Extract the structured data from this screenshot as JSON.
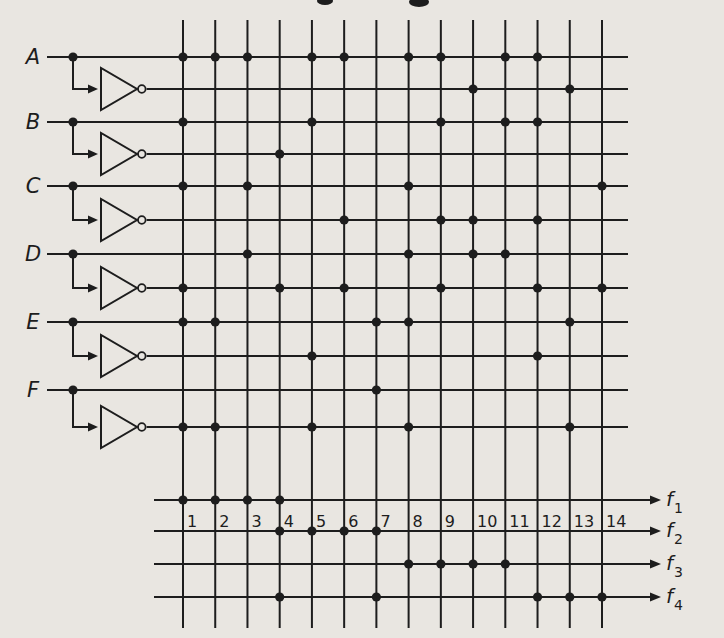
{
  "diagram": {
    "background_color": "#e9e6e1",
    "ink_color": "#1d1d1d",
    "inputs": [
      {
        "label": "A",
        "row_y": 57,
        "comp_y": 89,
        "true_term_dots": [
          1,
          2,
          3,
          5,
          6,
          8,
          9,
          11,
          12
        ],
        "comp_term_dots": [
          10,
          13
        ]
      },
      {
        "label": "B",
        "row_y": 122,
        "comp_y": 154,
        "true_term_dots": [
          1,
          5,
          9,
          11,
          12
        ],
        "comp_term_dots": [
          4
        ]
      },
      {
        "label": "C",
        "row_y": 186,
        "comp_y": 220,
        "true_term_dots": [
          1,
          3,
          8,
          14
        ],
        "comp_term_dots": [
          6,
          9,
          10,
          12
        ]
      },
      {
        "label": "D",
        "row_y": 254,
        "comp_y": 288,
        "true_term_dots": [
          3,
          8,
          10,
          11
        ],
        "comp_term_dots": [
          1,
          4,
          6,
          9,
          12,
          14
        ]
      },
      {
        "label": "E",
        "row_y": 322,
        "comp_y": 356,
        "true_term_dots": [
          1,
          2,
          7,
          8,
          13
        ],
        "comp_term_dots": [
          5,
          12
        ]
      },
      {
        "label": "F",
        "row_y": 390,
        "comp_y": 427,
        "true_term_dots": [
          7
        ],
        "comp_term_dots": [
          1,
          2,
          5,
          8,
          13
        ]
      }
    ],
    "product_terms": {
      "count": 14,
      "labels": [
        "1",
        "2",
        "3",
        "4",
        "5",
        "6",
        "7",
        "8",
        "9",
        "10",
        "11",
        "12",
        "13",
        "14"
      ],
      "x_start": 183,
      "x_end": 602,
      "y_top": 20,
      "y_bottom": 628,
      "label_baseline_y": 527
    },
    "outputs": [
      {
        "label": "f",
        "subscript": "1",
        "y": 500,
        "term_dots": [
          1,
          2,
          3,
          4
        ]
      },
      {
        "label": "f",
        "subscript": "2",
        "y": 531,
        "term_dots": [
          4,
          5,
          6,
          7
        ]
      },
      {
        "label": "f",
        "subscript": "3",
        "y": 564,
        "term_dots": [
          8,
          9,
          10,
          11
        ]
      },
      {
        "label": "f",
        "subscript": "4",
        "y": 597,
        "term_dots": [
          4,
          7,
          12,
          13,
          14
        ]
      }
    ],
    "geometry": {
      "input_line_x_start": 47,
      "input_line_x_end": 628,
      "input_label_x": 33,
      "branch_x": 73,
      "inverter_left_x": 101,
      "inverter_tip_x": 137,
      "inverter_half_height": 21,
      "bubble_radius": 3.8,
      "output_line_x_start": 154,
      "output_arrow_tip_x": 661,
      "output_label_x": 666,
      "dot_radius": 4.6,
      "stroke_width": 2
    },
    "crop_artifacts": [
      {
        "cx": 325,
        "cy": 1,
        "rx": 8,
        "ry": 4
      },
      {
        "cx": 419,
        "cy": 2,
        "rx": 10,
        "ry": 5
      }
    ]
  }
}
